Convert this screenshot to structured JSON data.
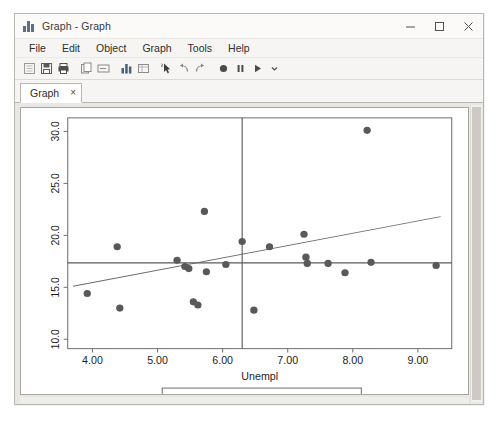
{
  "window": {
    "title": "Graph - Graph",
    "icon": "bar-chart-icon",
    "controls": {
      "minimize": "–",
      "maximize": "□",
      "close": "×"
    }
  },
  "menu": {
    "items": [
      {
        "label": "File",
        "accel": "F"
      },
      {
        "label": "Edit",
        "accel": "E"
      },
      {
        "label": "Object",
        "accel": "b"
      },
      {
        "label": "Graph",
        "accel": "G"
      },
      {
        "label": "Tools",
        "accel": "T"
      },
      {
        "label": "Help",
        "accel": "H"
      }
    ]
  },
  "toolbar": {
    "buttons": [
      {
        "name": "new-icon",
        "title": "New"
      },
      {
        "name": "save-icon",
        "title": "Save"
      },
      {
        "name": "print-icon",
        "title": "Print"
      },
      {
        "name": "copy-icon",
        "title": "Copy"
      },
      {
        "name": "rename-icon",
        "title": "Rename"
      },
      {
        "name": "start-graph-editor-icon",
        "title": "Start Graph Editor"
      },
      {
        "name": "grid-edit-icon",
        "title": "Grid Edit"
      },
      {
        "name": "pointer-tool-icon",
        "title": "Pointer Tool"
      },
      {
        "name": "undo-icon",
        "title": "Undo"
      },
      {
        "name": "redo-icon",
        "title": "Redo"
      },
      {
        "name": "record-icon",
        "title": "Record"
      },
      {
        "name": "pause-icon",
        "title": "Pause"
      },
      {
        "name": "play-icon",
        "title": "Play"
      },
      {
        "name": "chevron-down-icon",
        "title": "More"
      }
    ]
  },
  "tabs": [
    {
      "label": "Graph",
      "close": "×",
      "active": true
    }
  ],
  "chart_data": {
    "type": "scatter",
    "title": "",
    "xlabel": "Unempl",
    "ylabel": "",
    "xlim": [
      3.62,
      9.52
    ],
    "ylim": [
      9.1,
      31.3
    ],
    "xticks": [
      "4.00",
      "5.00",
      "6.00",
      "7.00",
      "8.00",
      "9.00"
    ],
    "xtick_values": [
      4.0,
      5.0,
      6.0,
      7.0,
      8.0,
      9.0
    ],
    "yticks": [
      "10.0",
      "15.0",
      "20.0",
      "25.0",
      "30.0"
    ],
    "ytick_values": [
      10.0,
      15.0,
      20.0,
      25.0,
      30.0
    ],
    "grid": false,
    "legend_position": "bottom",
    "legend": [
      {
        "label": "GovtAsst",
        "marker": "circle",
        "color": "#595959"
      },
      {
        "label": "Fitted values",
        "marker": "line",
        "color": "#6b6b6b"
      }
    ],
    "series": [
      {
        "name": "GovtAsst",
        "marker": "circle",
        "color": "#595959",
        "points": [
          {
            "x": 3.92,
            "y": 14.4
          },
          {
            "x": 4.38,
            "y": 18.9
          },
          {
            "x": 4.42,
            "y": 13.0
          },
          {
            "x": 5.3,
            "y": 17.6
          },
          {
            "x": 5.42,
            "y": 17.0
          },
          {
            "x": 5.48,
            "y": 16.8
          },
          {
            "x": 5.55,
            "y": 13.6
          },
          {
            "x": 5.62,
            "y": 13.3
          },
          {
            "x": 5.72,
            "y": 22.3
          },
          {
            "x": 5.75,
            "y": 16.5
          },
          {
            "x": 6.05,
            "y": 17.2
          },
          {
            "x": 6.3,
            "y": 19.4
          },
          {
            "x": 6.48,
            "y": 12.8
          },
          {
            "x": 6.72,
            "y": 18.9
          },
          {
            "x": 7.25,
            "y": 20.1
          },
          {
            "x": 7.28,
            "y": 17.9
          },
          {
            "x": 7.3,
            "y": 17.3
          },
          {
            "x": 7.62,
            "y": 17.3
          },
          {
            "x": 7.88,
            "y": 16.4
          },
          {
            "x": 8.22,
            "y": 30.1
          },
          {
            "x": 8.28,
            "y": 17.4
          },
          {
            "x": 9.28,
            "y": 17.1
          }
        ]
      },
      {
        "name": "Fitted values",
        "type": "line",
        "color": "#6b6b6b",
        "endpoints": [
          {
            "x": 3.7,
            "y": 15.1
          },
          {
            "x": 9.35,
            "y": 21.8
          }
        ]
      }
    ],
    "reference_lines": [
      {
        "name": "vertical-mean-line",
        "orientation": "vertical",
        "x": 6.3,
        "color": "#5a5a5a"
      },
      {
        "name": "horizontal-mean-line",
        "orientation": "horizontal",
        "y": 17.35,
        "color": "#5a5a5a"
      }
    ]
  }
}
